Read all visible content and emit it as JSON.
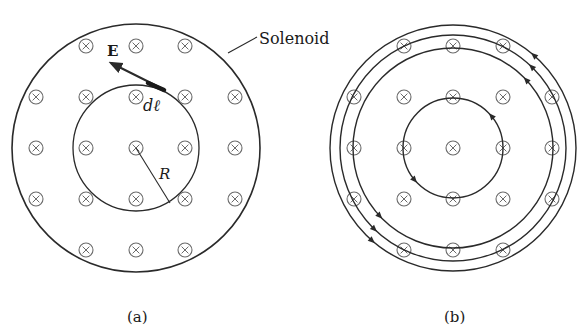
{
  "panels": {
    "a": {
      "caption": "(a)",
      "solenoid_label": "Solenoid",
      "field_label": "E",
      "element_label": "dℓ",
      "radius_label": "R",
      "center": [
        136,
        148
      ],
      "outer_radius": 124,
      "inner_radius": 63,
      "grid_x": [
        36,
        86,
        136,
        185,
        235
      ],
      "grid_y": [
        46,
        97,
        148,
        199,
        250
      ]
    },
    "b": {
      "caption": "(b)",
      "center": [
        453,
        148
      ],
      "loop_radii": [
        50,
        100,
        113,
        123
      ],
      "grid_x": [
        354,
        404,
        453,
        503,
        552
      ],
      "grid_y": [
        46,
        97,
        148,
        199,
        250
      ]
    }
  },
  "symbols": {
    "into_page": "⊗"
  },
  "colors": {
    "line": "#2a2a2a",
    "symbol": "#6a6a6a",
    "text": "#1a1a1a"
  }
}
